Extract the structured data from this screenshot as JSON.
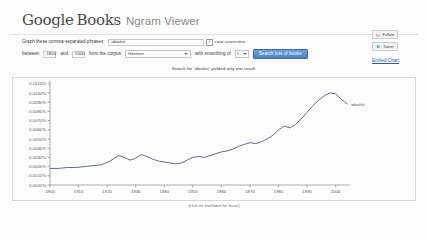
{
  "header": {
    "logo_google": "Google",
    "logo_books": "Books",
    "product": "Ngram Viewer"
  },
  "form": {
    "phrase_label": "Graph these comma-separated phrases:",
    "phrase_value": "idealist",
    "phrase_placeholder": "",
    "case_insensitive_label": "case-insensitive",
    "case_insensitive_checked": "✓",
    "between_label": "between",
    "year_start": "1800",
    "and_label": "and",
    "year_end": "2000",
    "corpus_label": "from the corpus",
    "corpus_value": "German",
    "smoothing_label": "with smoothing of",
    "smoothing_value": "1",
    "search_button": "Search lots of books"
  },
  "rail": {
    "follow_label": "Follow",
    "follow_icon": "g-plus-icon",
    "tweet_label": "Tweet",
    "tweet_icon": "twitter-bird-icon",
    "embed_label": "Embed Chart"
  },
  "notice": "Search for \"idealist\" yielded only one result.",
  "caption": "(click on line/label for focus)",
  "series_label": "idealist",
  "colors": {
    "accent": "#4a7fc8",
    "line": "#4f5a8f",
    "link": "#2d5aa8",
    "axis": "#777777",
    "grid": "#e8e8e8"
  },
  "chart_data": {
    "type": "line",
    "title": "",
    "xlabel": "",
    "ylabel": "",
    "xlim": [
      1900,
      2005
    ],
    "ylim": [
      0.0,
      0.0113
    ],
    "grid": false,
    "legend_position": "right-inline",
    "xticks": [
      1900,
      1910,
      1920,
      1930,
      1940,
      1950,
      1960,
      1970,
      1980,
      1990,
      2000
    ],
    "yticks": [
      "0.0000%",
      "0.0010%",
      "0.0020%",
      "0.0030%",
      "0.0040%",
      "0.0050%",
      "0.0060%",
      "0.0070%",
      "0.0080%",
      "0.0090%",
      "0.0100%",
      "0.0110%"
    ],
    "ytick_values": [
      0.0,
      0.001,
      0.002,
      0.003,
      0.004,
      0.005,
      0.006,
      0.007,
      0.008,
      0.009,
      0.01,
      0.011
    ],
    "series": [
      {
        "name": "idealist",
        "color": "#4f5a8f",
        "x": [
          1900,
          1903,
          1906,
          1909,
          1912,
          1915,
          1918,
          1921,
          1924,
          1926,
          1928,
          1930,
          1932,
          1934,
          1936,
          1938,
          1940,
          1942,
          1944,
          1946,
          1948,
          1950,
          1952,
          1954,
          1956,
          1958,
          1960,
          1962,
          1964,
          1966,
          1968,
          1970,
          1972,
          1974,
          1976,
          1978,
          1980,
          1982,
          1984,
          1986,
          1988,
          1990,
          1992,
          1994,
          1996,
          1998,
          2000,
          2002,
          2004
        ],
        "values": [
          0.0018,
          0.0018,
          0.0019,
          0.0019,
          0.002,
          0.0021,
          0.0022,
          0.0026,
          0.0032,
          0.003,
          0.0027,
          0.0029,
          0.0033,
          0.0031,
          0.0028,
          0.0026,
          0.0025,
          0.0024,
          0.0023,
          0.0024,
          0.0027,
          0.003,
          0.0031,
          0.003,
          0.0032,
          0.0034,
          0.0036,
          0.0037,
          0.0039,
          0.0042,
          0.0044,
          0.0046,
          0.0045,
          0.0047,
          0.005,
          0.0054,
          0.006,
          0.0064,
          0.0062,
          0.0066,
          0.0072,
          0.0079,
          0.0086,
          0.0092,
          0.0097,
          0.01,
          0.0099,
          0.0093,
          0.0088
        ]
      }
    ]
  }
}
